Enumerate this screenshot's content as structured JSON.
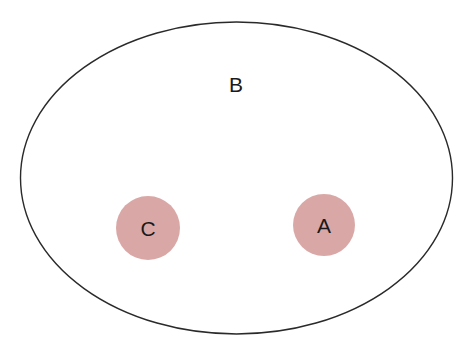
{
  "diagram": {
    "type": "venn-containment",
    "outer_set": {
      "label": "B",
      "shape": "ellipse",
      "stroke_color": "#2a2a2a",
      "fill_color": "#ffffff"
    },
    "inner_sets": [
      {
        "label": "C",
        "shape": "circle",
        "fill_color": "#d9a8a6"
      },
      {
        "label": "A",
        "shape": "circle",
        "fill_color": "#d9a8a6"
      }
    ],
    "relationships": [
      "C is a subset of B",
      "A is a subset of B",
      "A and C are disjoint"
    ]
  }
}
